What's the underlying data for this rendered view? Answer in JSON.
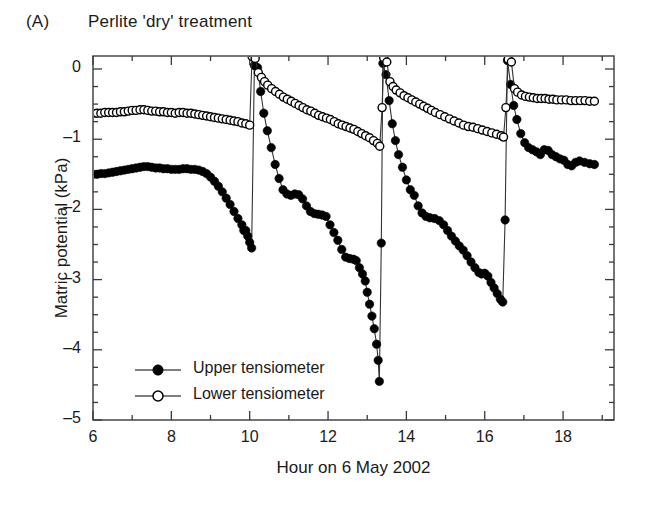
{
  "figure": {
    "panel_label": "(A)",
    "title": "Perlite 'dry' treatment"
  },
  "chart_data": {
    "type": "line",
    "title": "Perlite 'dry' treatment",
    "panel": "(A)",
    "xlabel": "Hour on 6 May 2002",
    "ylabel": "Matric potential (kPa)",
    "xlim": [
      6,
      19.3
    ],
    "ylim": [
      -5,
      0.3
    ],
    "xticks": [
      6,
      8,
      10,
      12,
      14,
      16,
      18
    ],
    "xtick_labels": [
      "6",
      "8",
      "10",
      "12",
      "14",
      "16",
      "18"
    ],
    "xminor_step": 1,
    "yticks": [
      0,
      -1,
      -2,
      -3,
      -4,
      -5
    ],
    "ytick_labels": [
      "0",
      "-1",
      "-2",
      "-3",
      "-4",
      "-5"
    ],
    "yminor_step": 0.25,
    "grid": false,
    "legend_position": "lower-left-inside",
    "marker_colors": {
      "upper": "#000000",
      "lower": "#ffffff",
      "marker_edge": "#000000",
      "line": "#333333",
      "axis": "#3a3a3a"
    },
    "series": [
      {
        "name": "Upper tensiometer",
        "marker": "filled-circle",
        "points": [
          [
            6.0,
            -1.5
          ],
          [
            6.1,
            -1.5
          ],
          [
            6.2,
            -1.49
          ],
          [
            6.3,
            -1.49
          ],
          [
            6.4,
            -1.48
          ],
          [
            6.5,
            -1.47
          ],
          [
            6.6,
            -1.46
          ],
          [
            6.7,
            -1.45
          ],
          [
            6.8,
            -1.44
          ],
          [
            6.9,
            -1.43
          ],
          [
            7.0,
            -1.42
          ],
          [
            7.1,
            -1.41
          ],
          [
            7.2,
            -1.4
          ],
          [
            7.3,
            -1.39
          ],
          [
            7.4,
            -1.39
          ],
          [
            7.5,
            -1.4
          ],
          [
            7.6,
            -1.41
          ],
          [
            7.7,
            -1.41
          ],
          [
            7.8,
            -1.42
          ],
          [
            7.9,
            -1.42
          ],
          [
            8.0,
            -1.43
          ],
          [
            8.1,
            -1.43
          ],
          [
            8.2,
            -1.43
          ],
          [
            8.3,
            -1.42
          ],
          [
            8.4,
            -1.42
          ],
          [
            8.5,
            -1.43
          ],
          [
            8.6,
            -1.43
          ],
          [
            8.7,
            -1.44
          ],
          [
            8.8,
            -1.46
          ],
          [
            8.9,
            -1.49
          ],
          [
            9.0,
            -1.54
          ],
          [
            9.1,
            -1.6
          ],
          [
            9.2,
            -1.67
          ],
          [
            9.3,
            -1.75
          ],
          [
            9.4,
            -1.84
          ],
          [
            9.5,
            -1.93
          ],
          [
            9.6,
            -2.03
          ],
          [
            9.7,
            -2.13
          ],
          [
            9.8,
            -2.22
          ],
          [
            9.85,
            -2.3
          ],
          [
            9.9,
            -2.3
          ],
          [
            9.95,
            -2.38
          ],
          [
            10.0,
            -2.47
          ],
          [
            10.05,
            -2.55
          ],
          [
            10.12,
            0.05
          ],
          [
            10.2,
            0.02
          ],
          [
            10.28,
            -0.32
          ],
          [
            10.36,
            -0.63
          ],
          [
            10.45,
            -0.88
          ],
          [
            10.55,
            -1.12
          ],
          [
            10.65,
            -1.36
          ],
          [
            10.75,
            -1.56
          ],
          [
            10.85,
            -1.72
          ],
          [
            10.95,
            -1.78
          ],
          [
            11.05,
            -1.8
          ],
          [
            11.15,
            -1.78
          ],
          [
            11.25,
            -1.79
          ],
          [
            11.35,
            -1.85
          ],
          [
            11.45,
            -1.95
          ],
          [
            11.55,
            -2.03
          ],
          [
            11.65,
            -2.06
          ],
          [
            11.75,
            -2.07
          ],
          [
            11.85,
            -2.08
          ],
          [
            11.95,
            -2.1
          ],
          [
            12.05,
            -2.22
          ],
          [
            12.15,
            -2.33
          ],
          [
            12.25,
            -2.44
          ],
          [
            12.35,
            -2.57
          ],
          [
            12.45,
            -2.68
          ],
          [
            12.55,
            -2.7
          ],
          [
            12.65,
            -2.71
          ],
          [
            12.72,
            -2.73
          ],
          [
            12.8,
            -2.83
          ],
          [
            12.88,
            -2.92
          ],
          [
            12.95,
            -3.02
          ],
          [
            13.0,
            -3.18
          ],
          [
            13.06,
            -3.35
          ],
          [
            13.12,
            -3.52
          ],
          [
            13.18,
            -3.7
          ],
          [
            13.24,
            -3.92
          ],
          [
            13.28,
            -4.15
          ],
          [
            13.31,
            -4.45
          ],
          [
            13.36,
            -2.48
          ],
          [
            13.4,
            0.08
          ],
          [
            13.48,
            -0.08
          ],
          [
            13.56,
            -0.45
          ],
          [
            13.64,
            -0.78
          ],
          [
            13.72,
            -1.02
          ],
          [
            13.8,
            -1.22
          ],
          [
            13.9,
            -1.4
          ],
          [
            14.0,
            -1.58
          ],
          [
            14.1,
            -1.72
          ],
          [
            14.2,
            -1.8
          ],
          [
            14.3,
            -1.95
          ],
          [
            14.4,
            -2.05
          ],
          [
            14.5,
            -2.1
          ],
          [
            14.6,
            -2.12
          ],
          [
            14.72,
            -2.13
          ],
          [
            14.84,
            -2.16
          ],
          [
            14.95,
            -2.22
          ],
          [
            15.05,
            -2.3
          ],
          [
            15.15,
            -2.38
          ],
          [
            15.25,
            -2.45
          ],
          [
            15.35,
            -2.52
          ],
          [
            15.45,
            -2.58
          ],
          [
            15.55,
            -2.66
          ],
          [
            15.65,
            -2.75
          ],
          [
            15.75,
            -2.83
          ],
          [
            15.85,
            -2.9
          ],
          [
            15.92,
            -2.92
          ],
          [
            16.0,
            -2.91
          ],
          [
            16.08,
            -2.95
          ],
          [
            16.16,
            -3.04
          ],
          [
            16.24,
            -3.12
          ],
          [
            16.32,
            -3.2
          ],
          [
            16.4,
            -3.28
          ],
          [
            16.46,
            -3.32
          ],
          [
            16.52,
            -2.15
          ],
          [
            16.58,
            0.12
          ],
          [
            16.66,
            -0.22
          ],
          [
            16.74,
            -0.52
          ],
          [
            16.82,
            -0.72
          ],
          [
            16.92,
            -0.92
          ],
          [
            17.02,
            -1.05
          ],
          [
            17.12,
            -1.12
          ],
          [
            17.22,
            -1.15
          ],
          [
            17.32,
            -1.18
          ],
          [
            17.42,
            -1.22
          ],
          [
            17.52,
            -1.15
          ],
          [
            17.62,
            -1.16
          ],
          [
            17.72,
            -1.22
          ],
          [
            17.82,
            -1.25
          ],
          [
            17.92,
            -1.28
          ],
          [
            18.02,
            -1.3
          ],
          [
            18.12,
            -1.36
          ],
          [
            18.22,
            -1.38
          ],
          [
            18.32,
            -1.33
          ],
          [
            18.42,
            -1.31
          ],
          [
            18.55,
            -1.33
          ],
          [
            18.68,
            -1.35
          ],
          [
            18.8,
            -1.36
          ]
        ]
      },
      {
        "name": "Lower tensiometer",
        "marker": "open-circle",
        "points": [
          [
            6.0,
            -0.63
          ],
          [
            6.1,
            -0.63
          ],
          [
            6.2,
            -0.63
          ],
          [
            6.3,
            -0.62
          ],
          [
            6.4,
            -0.62
          ],
          [
            6.5,
            -0.62
          ],
          [
            6.6,
            -0.62
          ],
          [
            6.7,
            -0.61
          ],
          [
            6.8,
            -0.61
          ],
          [
            6.9,
            -0.6
          ],
          [
            7.0,
            -0.59
          ],
          [
            7.1,
            -0.59
          ],
          [
            7.2,
            -0.58
          ],
          [
            7.3,
            -0.58
          ],
          [
            7.4,
            -0.59
          ],
          [
            7.5,
            -0.6
          ],
          [
            7.6,
            -0.6
          ],
          [
            7.7,
            -0.61
          ],
          [
            7.8,
            -0.61
          ],
          [
            7.9,
            -0.62
          ],
          [
            8.0,
            -0.62
          ],
          [
            8.1,
            -0.63
          ],
          [
            8.2,
            -0.62
          ],
          [
            8.3,
            -0.62
          ],
          [
            8.4,
            -0.63
          ],
          [
            8.5,
            -0.63
          ],
          [
            8.6,
            -0.64
          ],
          [
            8.7,
            -0.65
          ],
          [
            8.8,
            -0.66
          ],
          [
            8.9,
            -0.67
          ],
          [
            9.0,
            -0.68
          ],
          [
            9.1,
            -0.69
          ],
          [
            9.2,
            -0.7
          ],
          [
            9.3,
            -0.71
          ],
          [
            9.4,
            -0.72
          ],
          [
            9.5,
            -0.73
          ],
          [
            9.6,
            -0.74
          ],
          [
            9.7,
            -0.75
          ],
          [
            9.8,
            -0.77
          ],
          [
            9.9,
            -0.78
          ],
          [
            10.0,
            -0.8
          ],
          [
            10.06,
            0.18
          ],
          [
            10.14,
            0.15
          ],
          [
            10.22,
            -0.05
          ],
          [
            10.3,
            -0.12
          ],
          [
            10.38,
            -0.18
          ],
          [
            10.46,
            -0.23
          ],
          [
            10.56,
            -0.28
          ],
          [
            10.66,
            -0.32
          ],
          [
            10.76,
            -0.36
          ],
          [
            10.86,
            -0.4
          ],
          [
            10.96,
            -0.43
          ],
          [
            11.06,
            -0.46
          ],
          [
            11.16,
            -0.49
          ],
          [
            11.26,
            -0.52
          ],
          [
            11.36,
            -0.55
          ],
          [
            11.46,
            -0.58
          ],
          [
            11.56,
            -0.6
          ],
          [
            11.66,
            -0.63
          ],
          [
            11.76,
            -0.66
          ],
          [
            11.86,
            -0.68
          ],
          [
            11.96,
            -0.7
          ],
          [
            12.06,
            -0.72
          ],
          [
            12.16,
            -0.75
          ],
          [
            12.26,
            -0.78
          ],
          [
            12.36,
            -0.8
          ],
          [
            12.46,
            -0.82
          ],
          [
            12.56,
            -0.84
          ],
          [
            12.66,
            -0.86
          ],
          [
            12.76,
            -0.89
          ],
          [
            12.86,
            -0.92
          ],
          [
            12.96,
            -0.95
          ],
          [
            13.06,
            -0.98
          ],
          [
            13.16,
            -1.02
          ],
          [
            13.26,
            -1.06
          ],
          [
            13.32,
            -1.1
          ],
          [
            13.38,
            -0.55
          ],
          [
            13.42,
            0.16
          ],
          [
            13.5,
            0.1
          ],
          [
            13.58,
            -0.18
          ],
          [
            13.66,
            -0.25
          ],
          [
            13.74,
            -0.3
          ],
          [
            13.84,
            -0.34
          ],
          [
            13.94,
            -0.38
          ],
          [
            14.04,
            -0.41
          ],
          [
            14.14,
            -0.44
          ],
          [
            14.24,
            -0.47
          ],
          [
            14.34,
            -0.5
          ],
          [
            14.44,
            -0.53
          ],
          [
            14.54,
            -0.56
          ],
          [
            14.64,
            -0.59
          ],
          [
            14.74,
            -0.62
          ],
          [
            14.86,
            -0.65
          ],
          [
            14.98,
            -0.68
          ],
          [
            15.1,
            -0.71
          ],
          [
            15.22,
            -0.74
          ],
          [
            15.34,
            -0.77
          ],
          [
            15.46,
            -0.8
          ],
          [
            15.58,
            -0.82
          ],
          [
            15.7,
            -0.83
          ],
          [
            15.82,
            -0.85
          ],
          [
            15.94,
            -0.87
          ],
          [
            16.06,
            -0.89
          ],
          [
            16.18,
            -0.91
          ],
          [
            16.3,
            -0.93
          ],
          [
            16.42,
            -0.95
          ],
          [
            16.48,
            -0.97
          ],
          [
            16.54,
            -0.55
          ],
          [
            16.6,
            0.14
          ],
          [
            16.68,
            0.1
          ],
          [
            16.76,
            -0.28
          ],
          [
            16.84,
            -0.33
          ],
          [
            16.94,
            -0.37
          ],
          [
            17.04,
            -0.39
          ],
          [
            17.14,
            -0.4
          ],
          [
            17.24,
            -0.41
          ],
          [
            17.34,
            -0.42
          ],
          [
            17.44,
            -0.42
          ],
          [
            17.54,
            -0.42
          ],
          [
            17.64,
            -0.43
          ],
          [
            17.74,
            -0.43
          ],
          [
            17.84,
            -0.44
          ],
          [
            17.96,
            -0.44
          ],
          [
            18.08,
            -0.44
          ],
          [
            18.2,
            -0.45
          ],
          [
            18.32,
            -0.45
          ],
          [
            18.44,
            -0.45
          ],
          [
            18.56,
            -0.45
          ],
          [
            18.68,
            -0.46
          ],
          [
            18.8,
            -0.46
          ]
        ]
      }
    ]
  },
  "legend": {
    "items": [
      {
        "label": "Upper tensiometer",
        "marker": "filled-circle"
      },
      {
        "label": "Lower tensiometer",
        "marker": "open-circle"
      }
    ]
  }
}
